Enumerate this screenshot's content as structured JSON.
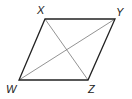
{
  "diagram": {
    "shape": "parallelogram",
    "colors": {
      "outline": "#222222",
      "diagonal": "#777777",
      "label": "#222222",
      "background": "#ffffff"
    },
    "vertices": [
      {
        "name": "X",
        "x": 45,
        "y": 19,
        "label_x": 37,
        "label_y": 14
      },
      {
        "name": "Y",
        "x": 115,
        "y": 19,
        "label_x": 116,
        "label_y": 16
      },
      {
        "name": "Z",
        "x": 88,
        "y": 80,
        "label_x": 88,
        "label_y": 93
      },
      {
        "name": "W",
        "x": 19,
        "y": 80,
        "label_x": 6,
        "label_y": 93
      }
    ],
    "diagonals": [
      [
        "X",
        "Z"
      ],
      [
        "W",
        "Y"
      ]
    ]
  }
}
